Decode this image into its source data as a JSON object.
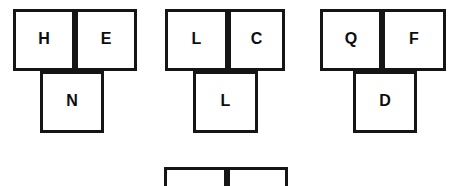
{
  "figure": {
    "background_color": "#ffffff",
    "stroke_color": "#151515",
    "text_color": "#0d0d0d",
    "shape_type": "T-tetromino-like tile groups of three squares",
    "groups": [
      {
        "id": "group-1",
        "top_row": [
          "H",
          "E"
        ],
        "bottom": [
          "N"
        ],
        "bottom_offset_cells": 0.45
      },
      {
        "id": "group-2",
        "top_row": [
          "L",
          "C"
        ],
        "bottom": [
          "L"
        ],
        "bottom_offset_cells": 0.45
      },
      {
        "id": "group-3",
        "top_row": [
          "Q",
          "F"
        ],
        "bottom": [
          "D"
        ],
        "bottom_offset_cells": 0.52
      },
      {
        "id": "group-4-partial",
        "top_row": [
          "",
          ""
        ],
        "bottom": [],
        "note": "clipped at bottom edge of frame"
      }
    ],
    "geometry": {
      "cells": [
        {
          "name": "cell-h",
          "label": "H",
          "x": 13,
          "y": 9,
          "w": 62,
          "h": 62
        },
        {
          "name": "cell-e",
          "label": "E",
          "x": 75,
          "y": 9,
          "w": 62,
          "h": 62
        },
        {
          "name": "cell-n",
          "label": "N",
          "x": 40,
          "y": 71,
          "w": 64,
          "h": 62
        },
        {
          "name": "cell-l1",
          "label": "L",
          "x": 165,
          "y": 9,
          "w": 63,
          "h": 62
        },
        {
          "name": "cell-c",
          "label": "C",
          "x": 228,
          "y": 9,
          "w": 57,
          "h": 62
        },
        {
          "name": "cell-l2",
          "label": "L",
          "x": 193,
          "y": 71,
          "w": 65,
          "h": 62
        },
        {
          "name": "cell-q",
          "label": "Q",
          "x": 320,
          "y": 9,
          "w": 62,
          "h": 62
        },
        {
          "name": "cell-f",
          "label": "F",
          "x": 382,
          "y": 9,
          "w": 64,
          "h": 62
        },
        {
          "name": "cell-d",
          "label": "D",
          "x": 353,
          "y": 71,
          "w": 64,
          "h": 62
        },
        {
          "name": "cell-partial-left",
          "label": "",
          "x": 164,
          "y": 167,
          "w": 63,
          "h": 40
        },
        {
          "name": "cell-partial-right",
          "label": "",
          "x": 227,
          "y": 167,
          "w": 61,
          "h": 40
        }
      ]
    }
  }
}
